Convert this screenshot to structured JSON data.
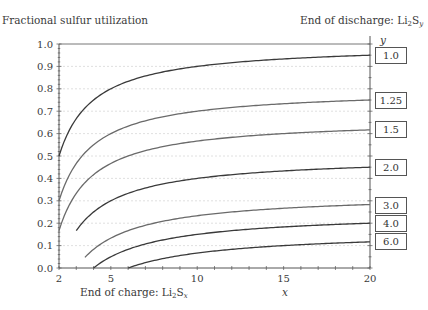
{
  "chart_data": {
    "type": "line",
    "title": "",
    "ylabel": "Fractional sulfur utilization",
    "xlabel": "x",
    "x_caption": "End of charge: Li2Sx",
    "legend_title": "End of discharge: Li2Sy",
    "legend_var": "y",
    "xlim": [
      2,
      20
    ],
    "ylim": [
      0.0,
      1.0
    ],
    "x_ticks": [
      "2",
      "5",
      "10",
      "15",
      "20"
    ],
    "y_ticks": [
      "0.0",
      "0.1",
      "0.2",
      "0.3",
      "0.4",
      "0.5",
      "0.6",
      "0.7",
      "0.8",
      "0.9",
      "1.0"
    ],
    "grid": "horizontal dotted",
    "formula": "utilization = 1/y - 1/x",
    "series": [
      {
        "name": "1.0",
        "y": 1.0,
        "x_start": 2,
        "start_value": 0.5,
        "end_value": 0.95,
        "color": "#3a3a3a"
      },
      {
        "name": "1.25",
        "y": 1.25,
        "x_start": 2,
        "start_value": 0.3,
        "end_value": 0.75,
        "color": "#6a6a6a"
      },
      {
        "name": "1.5",
        "y": 1.5,
        "x_start": 2,
        "start_value": 0.17,
        "end_value": 0.62,
        "color": "#6a6a6a"
      },
      {
        "name": "2.0",
        "y": 2.0,
        "x_start": 3,
        "start_value": 0.17,
        "end_value": 0.45,
        "color": "#3a3a3a"
      },
      {
        "name": "3.0",
        "y": 3.0,
        "x_start": 3.5,
        "start_value": 0.05,
        "end_value": 0.28,
        "color": "#6a6a6a"
      },
      {
        "name": "4.0",
        "y": 4.0,
        "x_start": 4,
        "start_value": 0.0,
        "end_value": 0.2,
        "color": "#3a3a3a"
      },
      {
        "name": "6.0",
        "y": 6.0,
        "x_start": 6,
        "start_value": 0.0,
        "end_value": 0.12,
        "color": "#3a3a3a"
      }
    ]
  },
  "labels": {
    "ylabel": "Fractional sulfur utilization",
    "legend_title_main": "End of discharge: Li",
    "legend_title_sub": "2",
    "legend_title_s": "S",
    "legend_title_var": "y",
    "x_caption_main": "End of charge: Li",
    "x_caption_sub": "2",
    "x_caption_s": "S",
    "x_caption_var": "x",
    "xlabel": "x",
    "legend_var": "y"
  }
}
